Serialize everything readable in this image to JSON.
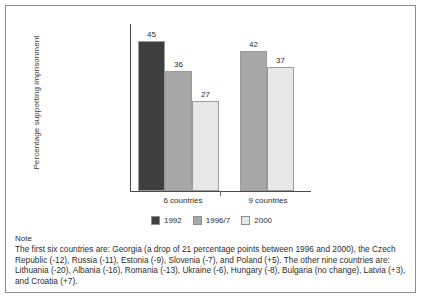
{
  "figure": {
    "note_heading": "Note",
    "note_text": "The first six countries are: Georgia (a drop of 21 percentage points between 1996 and 2000), the Czech Republic (-12), Russia (-11), Estonia (-9), Slovenia (-7), and Poland (+5). The other nine countries are: Lithuania (-20), Albania (-16), Romania (-13), Ukraine (-6), Hungary (-8), Bulgaria (no change), Latvia (+3), and Croatia (+7)."
  },
  "chart_data": {
    "type": "bar",
    "title": "",
    "xlabel": "",
    "ylabel": "Percentage supporting imprisonment",
    "categories": [
      "6 countries",
      "9 countries"
    ],
    "ylim": [
      0,
      50
    ],
    "grid": false,
    "legend_position": "bottom",
    "series": [
      {
        "name": "1992",
        "color": "#3f3f3f",
        "values": [
          45,
          null
        ]
      },
      {
        "name": "1996/7",
        "color": "#a8a8a8",
        "values": [
          36,
          42
        ]
      },
      {
        "name": "2000",
        "color": "#e8e8e8",
        "values": [
          27,
          37
        ]
      }
    ],
    "bars": [
      {
        "group": "6 countries",
        "series": "1992",
        "value": 45,
        "label": "45",
        "color": "#3f3f3f"
      },
      {
        "group": "6 countries",
        "series": "1996/7",
        "value": 36,
        "label": "36",
        "color": "#a8a8a8"
      },
      {
        "group": "6 countries",
        "series": "2000",
        "value": 27,
        "label": "27",
        "color": "#e8e8e8"
      },
      {
        "group": "9 countries",
        "series": "1996/7",
        "value": 42,
        "label": "42",
        "color": "#a8a8a8"
      },
      {
        "group": "9 countries",
        "series": "2000",
        "value": 37,
        "label": "37",
        "color": "#e8e8e8"
      }
    ]
  }
}
